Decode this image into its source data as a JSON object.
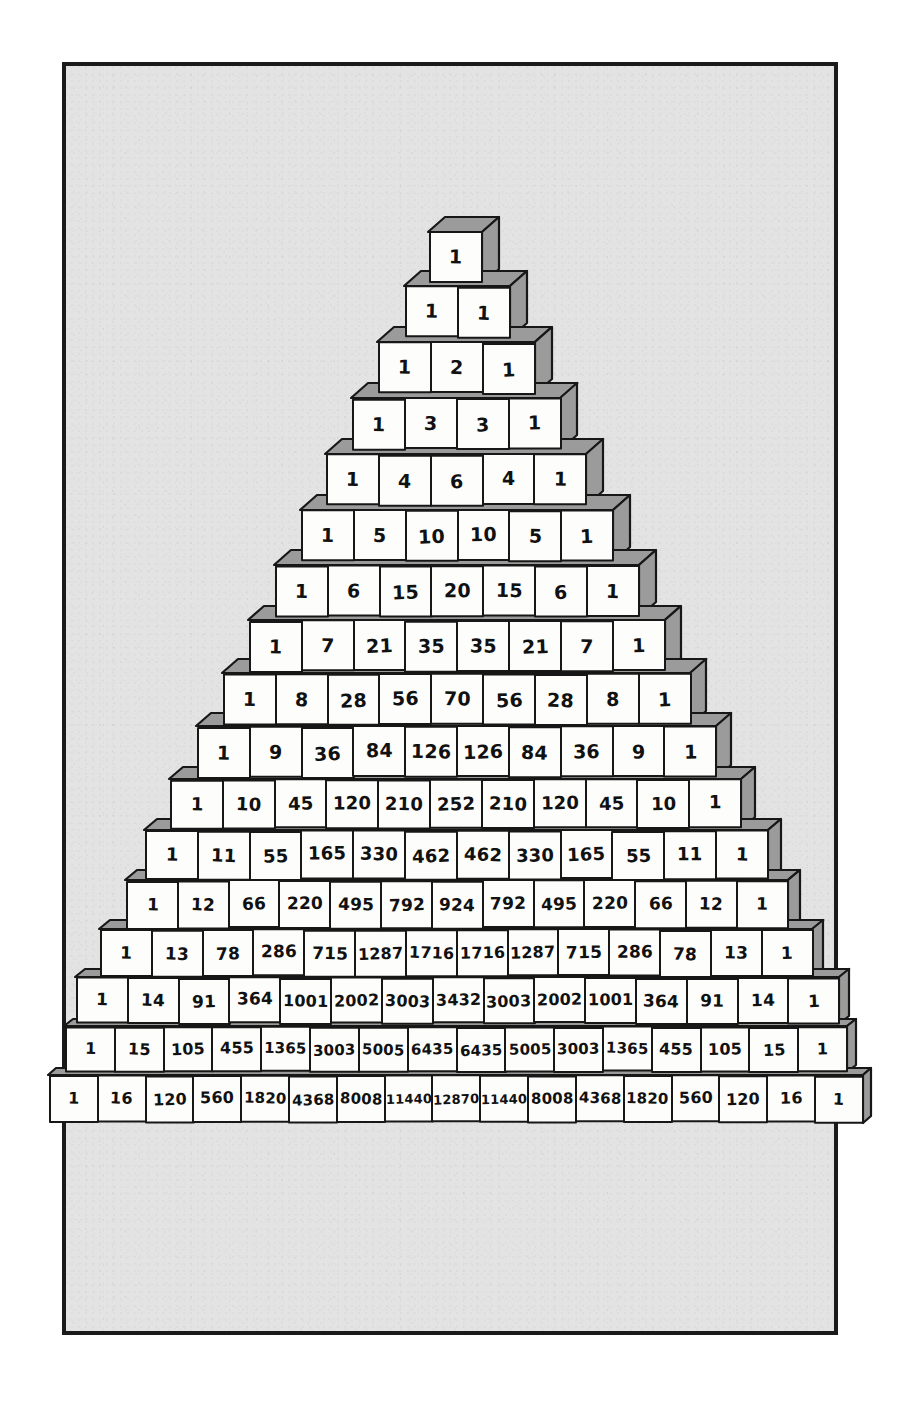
{
  "figure": {
    "name": "pascals-triangle-blocks",
    "style": "hand-drawn isometric cubes",
    "frame_border_color": "#1a1a1a",
    "panel_color": "#e3e3e3",
    "cube_face_color": "#fdfdfb",
    "cube_shade_color": "#9b9b9b",
    "ink_color": "#171717",
    "rows_count": 17
  },
  "chart_data": {
    "type": "table",
    "xlabel": "",
    "ylabel": "",
    "grid": false,
    "legend": "none",
    "rows": [
      {
        "n": 0,
        "values": [
          1
        ]
      },
      {
        "n": 1,
        "values": [
          1,
          1
        ]
      },
      {
        "n": 2,
        "values": [
          1,
          2,
          1
        ]
      },
      {
        "n": 3,
        "values": [
          1,
          3,
          3,
          1
        ]
      },
      {
        "n": 4,
        "values": [
          1,
          4,
          6,
          4,
          1
        ]
      },
      {
        "n": 5,
        "values": [
          1,
          5,
          10,
          10,
          5,
          1
        ]
      },
      {
        "n": 6,
        "values": [
          1,
          6,
          15,
          20,
          15,
          6,
          1
        ]
      },
      {
        "n": 7,
        "values": [
          1,
          7,
          21,
          35,
          35,
          21,
          7,
          1
        ]
      },
      {
        "n": 8,
        "values": [
          1,
          8,
          28,
          56,
          70,
          56,
          28,
          8,
          1
        ]
      },
      {
        "n": 9,
        "values": [
          1,
          9,
          36,
          84,
          126,
          126,
          84,
          36,
          9,
          1
        ]
      },
      {
        "n": 10,
        "values": [
          1,
          10,
          45,
          120,
          210,
          252,
          210,
          120,
          45,
          10,
          1
        ]
      },
      {
        "n": 11,
        "values": [
          1,
          11,
          55,
          165,
          330,
          462,
          462,
          330,
          165,
          55,
          11,
          1
        ]
      },
      {
        "n": 12,
        "values": [
          1,
          12,
          66,
          220,
          495,
          792,
          924,
          792,
          495,
          220,
          66,
          12,
          1
        ]
      },
      {
        "n": 13,
        "values": [
          1,
          13,
          78,
          286,
          715,
          1287,
          1716,
          1716,
          1287,
          715,
          286,
          78,
          13,
          1
        ]
      },
      {
        "n": 14,
        "values": [
          1,
          14,
          91,
          364,
          1001,
          2002,
          3003,
          3432,
          3003,
          2002,
          1001,
          364,
          91,
          14,
          1
        ]
      },
      {
        "n": 15,
        "values": [
          1,
          15,
          105,
          455,
          1365,
          3003,
          5005,
          6435,
          6435,
          5005,
          3003,
          1365,
          455,
          105,
          15,
          1
        ]
      },
      {
        "n": 16,
        "values": [
          1,
          16,
          120,
          560,
          1820,
          4368,
          8008,
          11440,
          12870,
          11440,
          8008,
          4368,
          1820,
          560,
          120,
          16,
          1
        ]
      }
    ]
  },
  "layout": {
    "row_geometry": [
      {
        "n": 0,
        "top": 232,
        "cw": 54,
        "ch": 52,
        "dx": 17,
        "dy": 15,
        "fs": 19
      },
      {
        "n": 1,
        "top": 286,
        "cw": 54,
        "ch": 52,
        "dx": 17,
        "dy": 15,
        "fs": 19
      },
      {
        "n": 2,
        "top": 342,
        "cw": 54,
        "ch": 52,
        "dx": 17,
        "dy": 15,
        "fs": 19
      },
      {
        "n": 3,
        "top": 398,
        "cw": 54,
        "ch": 52,
        "dx": 17,
        "dy": 15,
        "fs": 19
      },
      {
        "n": 4,
        "top": 454,
        "cw": 54,
        "ch": 52,
        "dx": 17,
        "dy": 15,
        "fs": 19
      },
      {
        "n": 5,
        "top": 510,
        "cw": 54,
        "ch": 52,
        "dx": 17,
        "dy": 15,
        "fs": 19
      },
      {
        "n": 6,
        "top": 565,
        "cw": 54,
        "ch": 52,
        "dx": 17,
        "dy": 15,
        "fs": 19
      },
      {
        "n": 7,
        "top": 620,
        "cw": 54,
        "ch": 52,
        "dx": 16,
        "dy": 14,
        "fs": 19
      },
      {
        "n": 8,
        "top": 673,
        "cw": 54,
        "ch": 52,
        "dx": 16,
        "dy": 14,
        "fs": 19
      },
      {
        "n": 9,
        "top": 726,
        "cw": 54,
        "ch": 52,
        "dx": 15,
        "dy": 13,
        "fs": 19
      },
      {
        "n": 10,
        "top": 779,
        "cw": 54,
        "ch": 50,
        "dx": 14,
        "dy": 12,
        "fs": 18
      },
      {
        "n": 11,
        "top": 830,
        "cw": 54,
        "ch": 50,
        "dx": 13,
        "dy": 11,
        "fs": 18
      },
      {
        "n": 12,
        "top": 880,
        "cw": 53,
        "ch": 49,
        "dx": 12,
        "dy": 10,
        "fs": 17
      },
      {
        "n": 13,
        "top": 929,
        "cw": 53,
        "ch": 48,
        "dx": 11,
        "dy": 9,
        "fs": 17
      },
      {
        "n": 14,
        "top": 977,
        "cw": 53,
        "ch": 47,
        "dx": 10,
        "dy": 8,
        "fs": 17
      },
      {
        "n": 15,
        "top": 1026,
        "cw": 51,
        "ch": 46,
        "dx": 9,
        "dy": 7,
        "fs": 16
      },
      {
        "n": 16,
        "top": 1075,
        "cw": 50,
        "ch": 48,
        "dx": 8,
        "dy": 7,
        "fs": 16
      }
    ]
  }
}
